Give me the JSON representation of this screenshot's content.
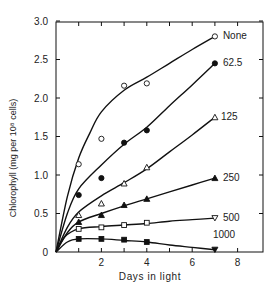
{
  "chart_data": {
    "type": "line",
    "title": "",
    "xlabel": "Days in light",
    "ylabel": "Chlorophyll (mg per 10⁸ cells)",
    "xlim": [
      0,
      9
    ],
    "ylim": [
      0,
      3.0
    ],
    "xticks": [
      2,
      4,
      6,
      8
    ],
    "xtick_minor": [
      1,
      3,
      5,
      7
    ],
    "yticks": [
      0,
      0.5,
      1.0,
      1.5,
      2.0,
      2.5,
      3.0
    ],
    "ytick_labels": [
      "0",
      "0.5",
      "1.0",
      "1.5",
      "2.0",
      "2.5",
      "3.0"
    ],
    "grid": false,
    "legend_position": "inline labels at right end of each curve",
    "series": [
      {
        "name": "None",
        "marker": "open-circle",
        "points": [
          [
            1,
            1.14
          ],
          [
            2,
            1.47
          ],
          [
            3,
            2.16
          ],
          [
            4,
            2.19
          ],
          [
            7,
            2.8
          ]
        ],
        "curve": [
          [
            0,
            0
          ],
          [
            0.5,
            0.72
          ],
          [
            1,
            1.22
          ],
          [
            1.5,
            1.55
          ],
          [
            2,
            1.82
          ],
          [
            3,
            2.1
          ],
          [
            4,
            2.27
          ],
          [
            5,
            2.45
          ],
          [
            6,
            2.63
          ],
          [
            7,
            2.8
          ]
        ]
      },
      {
        "name": "62.5",
        "marker": "filled-circle",
        "points": [
          [
            1,
            0.74
          ],
          [
            2,
            0.96
          ],
          [
            3,
            1.42
          ],
          [
            4,
            1.58
          ],
          [
            7,
            2.45
          ]
        ],
        "curve": [
          [
            0,
            0
          ],
          [
            0.5,
            0.5
          ],
          [
            1,
            0.82
          ],
          [
            2,
            1.13
          ],
          [
            3,
            1.4
          ],
          [
            4,
            1.62
          ],
          [
            5,
            1.9
          ],
          [
            6,
            2.17
          ],
          [
            7,
            2.45
          ]
        ]
      },
      {
        "name": "125",
        "marker": "open-triangle",
        "points": [
          [
            1,
            0.48
          ],
          [
            2,
            0.63
          ],
          [
            3,
            0.89
          ],
          [
            4,
            1.1
          ],
          [
            7,
            1.75
          ]
        ],
        "curve": [
          [
            0,
            0
          ],
          [
            0.5,
            0.32
          ],
          [
            1,
            0.52
          ],
          [
            2,
            0.73
          ],
          [
            3,
            0.9
          ],
          [
            4,
            1.08
          ],
          [
            5,
            1.3
          ],
          [
            6,
            1.52
          ],
          [
            7,
            1.75
          ]
        ]
      },
      {
        "name": "250",
        "marker": "filled-triangle",
        "points": [
          [
            1,
            0.39
          ],
          [
            2,
            0.48
          ],
          [
            3,
            0.61
          ],
          [
            4,
            0.69
          ],
          [
            7,
            0.96
          ]
        ],
        "curve": [
          [
            0,
            0
          ],
          [
            0.5,
            0.25
          ],
          [
            1,
            0.39
          ],
          [
            2,
            0.5
          ],
          [
            3,
            0.6
          ],
          [
            4,
            0.69
          ],
          [
            5,
            0.78
          ],
          [
            6,
            0.87
          ],
          [
            7,
            0.96
          ]
        ]
      },
      {
        "name": "500",
        "marker": "open-square",
        "points": [
          [
            1,
            0.3
          ],
          [
            2,
            0.32
          ],
          [
            3,
            0.35
          ],
          [
            4,
            0.38
          ],
          [
            7,
            0.44
          ]
        ],
        "end_marker": "open-inverted-triangle",
        "curve": [
          [
            0,
            0
          ],
          [
            0.4,
            0.2
          ],
          [
            1,
            0.3
          ],
          [
            2,
            0.33
          ],
          [
            3,
            0.35
          ],
          [
            4,
            0.37
          ],
          [
            5,
            0.4
          ],
          [
            6,
            0.42
          ],
          [
            7,
            0.44
          ]
        ]
      },
      {
        "name": "1000",
        "marker": "filled-square",
        "points": [
          [
            1,
            0.17
          ],
          [
            2,
            0.17
          ],
          [
            3,
            0.16
          ],
          [
            4,
            0.13
          ],
          [
            7,
            0.03
          ]
        ],
        "end_marker": "filled-inverted-triangle",
        "curve": [
          [
            0,
            0
          ],
          [
            0.5,
            0.13
          ],
          [
            1,
            0.17
          ],
          [
            2,
            0.17
          ],
          [
            3,
            0.15
          ],
          [
            4,
            0.13
          ],
          [
            5,
            0.09
          ],
          [
            6,
            0.06
          ],
          [
            7,
            0.03
          ]
        ]
      }
    ]
  },
  "layout": {
    "origin_x": 56,
    "origin_y": 252,
    "px_per_day": 22.7,
    "px_per_unit": 77,
    "frame_right": 263,
    "frame_top": 22,
    "line_color": "#111111"
  }
}
